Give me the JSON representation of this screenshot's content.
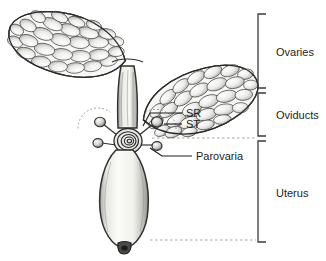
{
  "figure": {
    "kind": "anatomical-line-drawing",
    "background_color": "#ffffff",
    "ink_color": "#1d1d1d",
    "line_color": "#3a3a3a",
    "fill_light": "#f4f4f2",
    "fill_mid": "#d8d8d4",
    "fill_dark": "#8d8d88",
    "dash_color": "#9a9a96"
  },
  "brackets": [
    {
      "id": "ovaries",
      "label": "Ovaries",
      "top": 14,
      "bottom": 88,
      "text_y": 53,
      "x": 258,
      "arm": 8
    },
    {
      "id": "oviducts",
      "label": "Oviducts",
      "top": 93,
      "bottom": 136,
      "text_y": 116,
      "x": 258,
      "arm": 8
    },
    {
      "id": "uterus",
      "label": "Uterus",
      "top": 141,
      "bottom": 242,
      "text_y": 194,
      "x": 258,
      "arm": 8
    }
  ],
  "callouts": [
    {
      "id": "sr",
      "label": "SR",
      "text_x": 186,
      "text_y": 112
    },
    {
      "id": "st",
      "label": "ST",
      "text_x": 186,
      "text_y": 128
    },
    {
      "id": "parovaria",
      "label": "Parovaria",
      "text_x": 196,
      "text_y": 156
    }
  ],
  "structures": {
    "ovary_left": {
      "name": "left ovary",
      "follicle_count": 34
    },
    "ovary_right": {
      "name": "right ovary",
      "follicle_count": 34
    },
    "oviduct_stalk": {
      "name": "common oviduct stalk"
    },
    "spiral_coil": {
      "name": "coiled receptaculum",
      "turns": 4
    },
    "parovaria_bulbs": {
      "name": "parovarian bulbs",
      "count": 4
    },
    "uterus_body": {
      "name": "uterus",
      "tip": "dark distal tip"
    }
  },
  "guide_lines": [
    {
      "id": "ovary-oviduct-divider",
      "y": 90,
      "x1": 168,
      "x2": 256
    },
    {
      "id": "oviduct-uterus-divider",
      "y": 138,
      "x1": 150,
      "x2": 256
    },
    {
      "id": "uterus-bottom",
      "y": 240,
      "x1": 150,
      "x2": 256
    }
  ]
}
